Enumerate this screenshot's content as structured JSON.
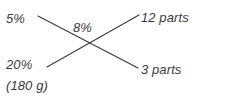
{
  "diagram": {
    "type": "criss-cross-dilution-method",
    "background_color": "#ffffff",
    "line_color": "#3a3a3a",
    "text_color": "#3a3a3a",
    "labels": {
      "top_left": "5%",
      "center": "8%",
      "top_right": "12 parts",
      "bottom_left": "20%",
      "bottom_right": "3 parts",
      "mass_note": "(180 g)"
    },
    "lines": [
      {
        "name": "top-left-to-bottom-right",
        "from": {
          "x": 38,
          "y": 16
        },
        "to": {
          "x": 138,
          "y": 68
        }
      },
      {
        "name": "bottom-left-to-top-right",
        "from": {
          "x": 47,
          "y": 67
        },
        "to": {
          "x": 139,
          "y": 15
        }
      }
    ],
    "crossing_point": {
      "x": 93,
      "y": 41
    }
  }
}
